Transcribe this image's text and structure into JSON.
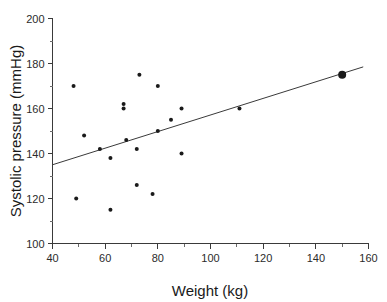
{
  "chart_data": {
    "type": "scatter",
    "title": "",
    "xlabel": "Weight  (kg)",
    "ylabel": "Systolic pressure (mmHg)",
    "xlim": [
      40,
      160
    ],
    "ylim": [
      100,
      200
    ],
    "grid": false,
    "legend": null,
    "x_ticks": [
      40,
      60,
      80,
      100,
      120,
      140,
      160
    ],
    "x_tick_labels": [
      "40",
      "60",
      "80",
      "100",
      "120",
      "140",
      "160"
    ],
    "x_minor_ticks": [
      50,
      70,
      90,
      110,
      130,
      150
    ],
    "y_ticks": [
      100,
      120,
      140,
      160,
      180,
      200
    ],
    "y_tick_labels": [
      "100",
      "120",
      "140",
      "160",
      "180",
      "200"
    ],
    "y_minor_ticks": [
      110,
      130,
      150,
      170,
      190
    ],
    "series": [
      {
        "name": "observations",
        "marker": "filled-circle",
        "marker_size": 4,
        "color": "#1a1a1a",
        "points": [
          {
            "x": 48,
            "y": 170
          },
          {
            "x": 49,
            "y": 120
          },
          {
            "x": 52,
            "y": 148
          },
          {
            "x": 58,
            "y": 142
          },
          {
            "x": 62,
            "y": 138
          },
          {
            "x": 62,
            "y": 115
          },
          {
            "x": 67,
            "y": 162
          },
          {
            "x": 67,
            "y": 160
          },
          {
            "x": 68,
            "y": 146
          },
          {
            "x": 72,
            "y": 142
          },
          {
            "x": 72,
            "y": 126
          },
          {
            "x": 73,
            "y": 175
          },
          {
            "x": 78,
            "y": 122
          },
          {
            "x": 80,
            "y": 170
          },
          {
            "x": 80,
            "y": 150
          },
          {
            "x": 85,
            "y": 155
          },
          {
            "x": 89,
            "y": 160
          },
          {
            "x": 89,
            "y": 140
          },
          {
            "x": 111,
            "y": 160
          }
        ]
      },
      {
        "name": "highlighted-observation",
        "marker": "filled-circle",
        "marker_size": 8,
        "color": "#1a1a1a",
        "points": [
          {
            "x": 150,
            "y": 175
          }
        ]
      }
    ],
    "fit_line": {
      "name": "regression-line",
      "color": "#3a3a3a",
      "x_start": 40,
      "y_start": 135,
      "x_end": 158,
      "y_end": 178.5
    }
  }
}
